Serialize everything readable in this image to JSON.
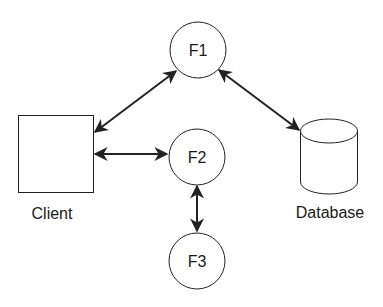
{
  "diagram": {
    "type": "architecture",
    "colors": {
      "stroke": "#222222",
      "fill": "#ffffff",
      "text": "#1a1a1a"
    },
    "nodes": [
      {
        "id": "client",
        "shape": "rectangle",
        "label": "Client"
      },
      {
        "id": "f1",
        "shape": "circle",
        "label": "F1"
      },
      {
        "id": "f2",
        "shape": "circle",
        "label": "F2"
      },
      {
        "id": "f3",
        "shape": "circle",
        "label": "F3"
      },
      {
        "id": "database",
        "shape": "cylinder",
        "label": "Database"
      }
    ],
    "edges": [
      {
        "from": "client",
        "to": "f1",
        "direction": "bidirectional"
      },
      {
        "from": "client",
        "to": "f2",
        "direction": "bidirectional"
      },
      {
        "from": "f1",
        "to": "database",
        "direction": "bidirectional"
      },
      {
        "from": "f2",
        "to": "f3",
        "direction": "bidirectional"
      }
    ]
  }
}
